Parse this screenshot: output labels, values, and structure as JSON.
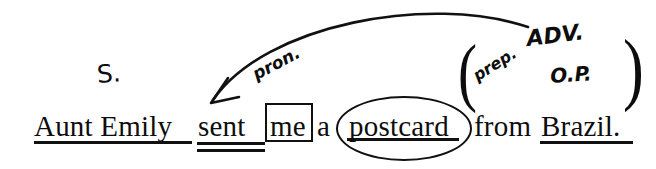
{
  "diagram": {
    "type": "sentence-diagram",
    "kind": "handwritten-grammar-annotation",
    "sentence_text": "Aunt Emily sent me a postcard from Brazil.",
    "ink_color": "#111111",
    "background_color": "#ffffff",
    "words": [
      {
        "id": "aunt_emily",
        "text": "Aunt Emily",
        "x": 34,
        "y": 112,
        "size": 29
      },
      {
        "id": "sent",
        "text": "sent",
        "x": 198,
        "y": 112,
        "size": 29
      },
      {
        "id": "me",
        "text": "me",
        "x": 270,
        "y": 112,
        "size": 29
      },
      {
        "id": "a",
        "text": "a",
        "x": 317,
        "y": 112,
        "size": 29
      },
      {
        "id": "postcard",
        "text": "postcard",
        "x": 349,
        "y": 112,
        "size": 29
      },
      {
        "id": "from",
        "text": "from",
        "x": 474,
        "y": 112,
        "size": 29
      },
      {
        "id": "brazil",
        "text": "Brazil.",
        "x": 541,
        "y": 112,
        "size": 29
      }
    ],
    "annotation_labels": [
      {
        "id": "subject",
        "text": "S.",
        "x": 96,
        "y": 62,
        "size": 25,
        "rotate": -4,
        "style": "plain"
      },
      {
        "id": "pronoun",
        "text": "pron.",
        "x": 258,
        "y": 66,
        "size": 17,
        "rotate": -28,
        "style": "script"
      },
      {
        "id": "preposition",
        "text": "prep.",
        "x": 479,
        "y": 68,
        "size": 16,
        "rotate": -32,
        "style": "script"
      },
      {
        "id": "object_of_prep",
        "text": "O.P.",
        "x": 551,
        "y": 66,
        "size": 20,
        "rotate": -4,
        "style": "script"
      },
      {
        "id": "adverb_phrase",
        "text": "ADV.",
        "x": 528,
        "y": 28,
        "size": 22,
        "rotate": -7,
        "style": "script"
      }
    ],
    "underlines": [
      {
        "id": "subject-underline",
        "x": 34,
        "y": 141,
        "width": 158,
        "height": 3,
        "label": "single underline under Aunt Emily"
      },
      {
        "id": "verb-underline-1",
        "x": 197,
        "y": 142,
        "width": 68,
        "height": 2.5,
        "label": "first line of double underline under sent"
      },
      {
        "id": "verb-underline-2",
        "x": 197,
        "y": 149,
        "width": 68,
        "height": 2.5,
        "label": "second line of double underline under sent"
      },
      {
        "id": "object-underline",
        "x": 347,
        "y": 138,
        "width": 112,
        "height": 2.5,
        "label": "underline under postcard"
      },
      {
        "id": "op-underline",
        "x": 540,
        "y": 141,
        "width": 93,
        "height": 2.5,
        "label": "underline under Brazil"
      }
    ],
    "shapes": {
      "me_box": {
        "id": "pronoun-box",
        "x": 265,
        "y": 103,
        "width": 44,
        "height": 35
      },
      "postcard_ellipse": {
        "id": "object-ellipse",
        "x": 336,
        "y": 96,
        "width": 132,
        "height": 61
      },
      "open_paren": {
        "text": "(",
        "x": 458,
        "y": 92,
        "size": 76
      },
      "close_paren": {
        "text": ")",
        "x": 623,
        "y": 90,
        "size": 80
      }
    },
    "arrow": {
      "id": "reference-arrow",
      "description": "curved arrow from ADV. label sweeping left down to the pronoun me / sent",
      "start": {
        "x": 528,
        "y": 27
      },
      "control_1": {
        "x": 430,
        "y": -6
      },
      "control_2": {
        "x": 265,
        "y": 24
      },
      "end": {
        "x": 212,
        "y": 102
      },
      "arrowhead_at": "end",
      "stroke_width": 2.6
    }
  }
}
